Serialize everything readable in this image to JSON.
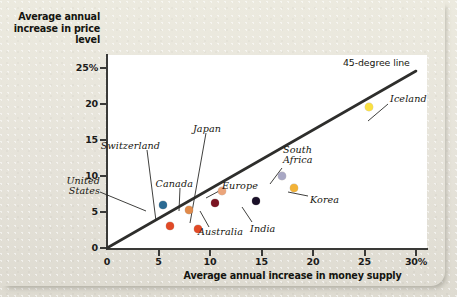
{
  "chart_data": {
    "type": "scatter",
    "title": "",
    "xlabel": "Average annual increase in money supply",
    "ylabel": "Average annual increase in price level",
    "xlim": [
      0,
      30
    ],
    "ylim": [
      0,
      27
    ],
    "grid": false,
    "legend": "none",
    "xticks": [
      "0",
      "5",
      "10",
      "15",
      "20",
      "25",
      "30%"
    ],
    "xtick_values": [
      0,
      5,
      10,
      15,
      20,
      25,
      30
    ],
    "yticks": [
      "0",
      "5",
      "10",
      "15",
      "20",
      "25%"
    ],
    "ytick_values": [
      0,
      5,
      10,
      15,
      20,
      25
    ],
    "annotations": [
      {
        "text": "45-degree line",
        "x": 27.5,
        "y": 25.5
      }
    ],
    "reference_line": {
      "label": "45-degree line",
      "from": [
        0,
        0
      ],
      "to": [
        30,
        30
      ]
    },
    "points": [
      {
        "name": "United States",
        "x": 5.4,
        "y": 6.0,
        "color": "#2b6a92"
      },
      {
        "name": "Switzerland",
        "x": 6.1,
        "y": 3.1,
        "color": "#e04a27"
      },
      {
        "name": "Canada",
        "x": 8.0,
        "y": 5.3,
        "color": "#e08a4a"
      },
      {
        "name": "Japan",
        "x": 8.8,
        "y": 2.7,
        "color": "#e04a27"
      },
      {
        "name": "Australia",
        "x": 10.5,
        "y": 6.2,
        "color": "#7a1421"
      },
      {
        "name": "Europe",
        "x": 11.2,
        "y": 7.9,
        "color": "#eba57b"
      },
      {
        "name": "India",
        "x": 14.5,
        "y": 6.6,
        "color": "#1a1029"
      },
      {
        "name": "South Africa",
        "x": 17.0,
        "y": 10.0,
        "color": "#a8a7c4"
      },
      {
        "name": "Korea",
        "x": 18.2,
        "y": 8.4,
        "color": "#f2b237"
      },
      {
        "name": "Iceland",
        "x": 25.4,
        "y": 19.6,
        "color": "#fae042"
      }
    ],
    "labels": [
      {
        "name": "United States",
        "text": "United\nStates",
        "x": 100,
        "y": 176,
        "align": "right",
        "lx": 100,
        "ly": 192,
        "tx": 146,
        "ty": 211
      },
      {
        "name": "Switzerland",
        "text": "Switzerland",
        "x": 160,
        "y": 141,
        "align": "right",
        "lx": 147,
        "ly": 150,
        "tx": 156,
        "ty": 221
      },
      {
        "name": "Canada",
        "text": "Canada",
        "x": 193,
        "y": 179,
        "align": "right",
        "lx": 180,
        "ly": 188,
        "tx": 179,
        "ty": 211
      },
      {
        "name": "Japan",
        "text": "Japan",
        "x": 221,
        "y": 124,
        "align": "right",
        "lx": 206,
        "ly": 133,
        "tx": 190,
        "ty": 223
      },
      {
        "name": "Australia",
        "text": "Australia",
        "x": 198,
        "y": 227,
        "align": "left",
        "lx": 209,
        "ly": 227,
        "tx": 200,
        "ty": 211
      },
      {
        "name": "Europe",
        "text": "Europe",
        "x": 222,
        "y": 181,
        "align": "left",
        "lx": 221,
        "ly": 190,
        "tx": 206,
        "ty": 198
      },
      {
        "name": "India",
        "text": "India",
        "x": 250,
        "y": 224,
        "align": "left",
        "lx": 252,
        "ly": 222,
        "tx": 242,
        "ty": 207
      },
      {
        "name": "South Africa",
        "text": "South\nAfrica",
        "x": 283,
        "y": 145,
        "align": "left",
        "lx": 282,
        "ly": 168,
        "tx": 270,
        "ty": 184
      },
      {
        "name": "Korea",
        "text": "Korea",
        "x": 310,
        "y": 195,
        "align": "left",
        "lx": 308,
        "ly": 196,
        "tx": 288,
        "ty": 192
      },
      {
        "name": "Iceland",
        "text": "Iceland",
        "x": 390,
        "y": 94,
        "align": "left",
        "lx": 388,
        "ly": 104,
        "tx": 368,
        "ty": 121
      }
    ]
  }
}
